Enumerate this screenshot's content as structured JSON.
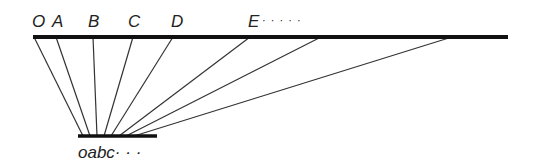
{
  "diagram": {
    "top_labels": [
      {
        "text": "O",
        "x": 32
      },
      {
        "text": "A",
        "x": 52
      },
      {
        "text": "B",
        "x": 88
      },
      {
        "text": "C",
        "x": 128
      },
      {
        "text": "D",
        "x": 171
      },
      {
        "text": "E",
        "x": 248
      }
    ],
    "top_ellipsis": "· · · · ·",
    "bottom_label": "oabc· · ·",
    "top_line": {
      "x1": 33,
      "x2": 508,
      "y": 37
    },
    "bottom_line": {
      "x1": 78,
      "x2": 157,
      "y": 136
    },
    "connectors": [
      {
        "top_x": 34,
        "bottom_x": 83
      },
      {
        "top_x": 56,
        "bottom_x": 90
      },
      {
        "top_x": 93,
        "bottom_x": 97
      },
      {
        "top_x": 133,
        "bottom_x": 104
      },
      {
        "top_x": 173,
        "bottom_x": 111
      },
      {
        "top_x": 250,
        "bottom_x": 119
      },
      {
        "top_x": 321,
        "bottom_x": 126
      },
      {
        "top_x": 452,
        "bottom_x": 134
      }
    ]
  }
}
